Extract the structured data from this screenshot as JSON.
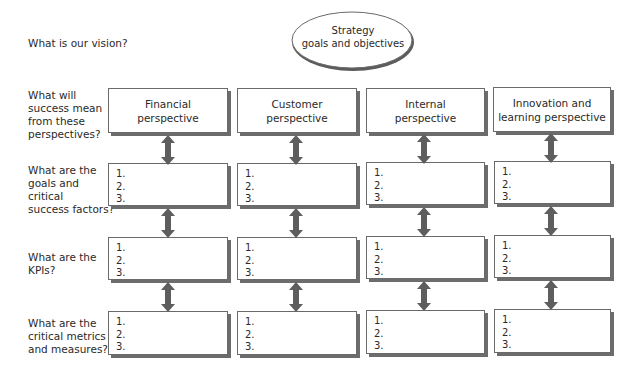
{
  "strategy": {
    "line1": "Strategy",
    "line2": "goals and objectives"
  },
  "questions": {
    "vision": "What is our vision?",
    "success": [
      "What will",
      "success mean",
      "from these",
      "perspectives?"
    ],
    "goals": [
      "What are the",
      "goals and",
      "critical",
      "success factors?"
    ],
    "kpis": [
      "What are the",
      "KPIs?"
    ],
    "metrics": [
      "What are the",
      "critical metrics",
      "and measures?"
    ]
  },
  "perspectives": [
    {
      "line1": "Financial",
      "line2": "perspective"
    },
    {
      "line1": "Customer",
      "line2": "perspective"
    },
    {
      "line1": "Internal",
      "line2": "perspective"
    },
    {
      "line1": "Innovation and",
      "line2": "learning perspective"
    }
  ],
  "list_items": [
    "1.",
    "2.",
    "3."
  ],
  "colors": {
    "border": "#6a6a6a",
    "shadow": "#6c6c6c",
    "arrow": "#5e5e5e",
    "text": "#2a2a2a"
  }
}
